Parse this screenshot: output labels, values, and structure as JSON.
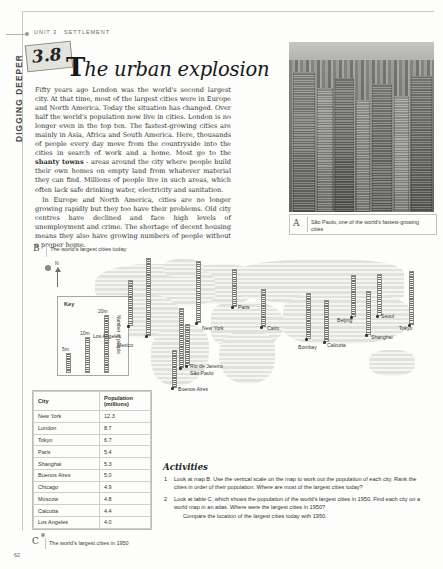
{
  "page": {
    "number": "62",
    "running_head": {
      "unit": "UNIT 3",
      "section": "SETTLEMENT"
    },
    "side_tab": "DIGGING DEEPER",
    "section_number": "3.8",
    "title_initial": "T",
    "title_rest": "he urban explosion"
  },
  "body": {
    "p1": "Fifty years ago London was the world's second largest city. At that time, most of the largest cities were in Europe and North America. Today the situation has changed. Over half the world's population now live in cities. London is no longer even in the top ten. The fastest-growing cities are mainly in Asia, Africa and South America. Here, thousands of people every day move from the countryside into the cities in search of work and a home. Most go to the ",
    "p1_bold": "shanty towns",
    "p1_cont": " - areas around the city where people build their own homes on empty land from whatever material they can find. Millions of people live in such areas, which often lack safe drinking water, electricity and sanitation.",
    "p2": "In Europe and North America, cities are no longer growing rapidly but they too have their problems. Old city centres have declined and face high levels of unemployment and crime. The shortage of decent housing means they also have growing numbers of people without a proper home."
  },
  "figure_a": {
    "label": "A",
    "caption": "São Paulo, one of the world's fastest-growing cities"
  },
  "figure_b": {
    "label": "B",
    "caption": "The world's largest cities today",
    "compass_label": "N",
    "key": {
      "title": "Key",
      "axis_label": "Number of people",
      "ticks": [
        "20m",
        "10m",
        "5m"
      ]
    }
  },
  "chart_data": {
    "type": "bar",
    "title": "The world's largest cities today",
    "xlabel": "",
    "ylabel": "Number of people (millions)",
    "ylim": [
      0,
      25
    ],
    "grid": false,
    "legend": "Key: bar height = number of people (5m, 10m, 20m scale marks)",
    "categories": [
      "Los Angeles",
      "Mexico",
      "New York",
      "Rio de Janeiro",
      "São Paulo",
      "Buenos Aires",
      "Paris",
      "Cairo",
      "Bombay",
      "Calcutta",
      "Beijing",
      "Shanghai",
      "Seoul",
      "Tokyo"
    ],
    "values": [
      14,
      23,
      20,
      13,
      20,
      12,
      16,
      11,
      15,
      13,
      14,
      17,
      17,
      21
    ]
  },
  "map_cities": [
    {
      "name": "Los Angeles",
      "bars_m": 14
    },
    {
      "name": "Mexico",
      "bars_m": 23
    },
    {
      "name": "New York",
      "bars_m": 20
    },
    {
      "name": "Rio de Janeiro",
      "bars_m": 13
    },
    {
      "name": "São Paulo",
      "bars_m": 20
    },
    {
      "name": "Buenos Aires",
      "bars_m": 12
    },
    {
      "name": "Paris",
      "bars_m": 16
    },
    {
      "name": "Cairo",
      "bars_m": 11
    },
    {
      "name": "Bombay",
      "bars_m": 15
    },
    {
      "name": "Calcutta",
      "bars_m": 13
    },
    {
      "name": "Beijing",
      "bars_m": 14
    },
    {
      "name": "Shanghai",
      "bars_m": 17
    },
    {
      "name": "Seoul",
      "bars_m": 17
    },
    {
      "name": "Tokyo",
      "bars_m": 21
    }
  ],
  "table_c": {
    "label": "C",
    "caption": "The world's largest cities in 1950",
    "headers": [
      "City",
      "Population (millions)"
    ],
    "header_city": "City",
    "header_pop_line1": "Population",
    "header_pop_line2": "(millions)",
    "rows": [
      {
        "city": "New York",
        "pop": "12.3"
      },
      {
        "city": "London",
        "pop": "8.7"
      },
      {
        "city": "Tokyo",
        "pop": "6.7"
      },
      {
        "city": "Paris",
        "pop": "5.4"
      },
      {
        "city": "Shanghai",
        "pop": "5.3"
      },
      {
        "city": "Buenos Aires",
        "pop": "5.0"
      },
      {
        "city": "Chicago",
        "pop": "4.9"
      },
      {
        "city": "Moscow",
        "pop": "4.8"
      },
      {
        "city": "Calcutta",
        "pop": "4.4"
      },
      {
        "city": "Los Angeles",
        "pop": "4.0"
      }
    ]
  },
  "activities": {
    "title": "Activities",
    "items": [
      {
        "n": "1",
        "text": "Look at map B. Use the vertical scale on the map to work out the population of each city. Rank the cities in order of their population. Where are most of the largest cities today?",
        "sub": ""
      },
      {
        "n": "2",
        "text": "Look at table C, which shows the population of the world's largest cities in 1950. Find each city on a world map in an atlas. Where were the largest cities in 1950?",
        "sub": "Compare the location of the largest cities today with 1950."
      }
    ]
  }
}
